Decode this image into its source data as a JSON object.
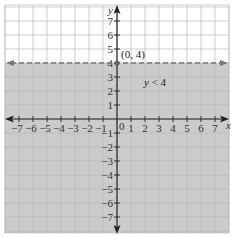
{
  "chart_data": {
    "type": "inequality_graph",
    "title": "",
    "inequality": "y < 4",
    "boundary_line": {
      "equation": "y = 4",
      "style": "dashed",
      "color": "#777777"
    },
    "labeled_point": {
      "x": 0,
      "y": 4,
      "label": "(0, 4)"
    },
    "shaded_region": "below boundary",
    "shade_color": "#cbcbcb",
    "xlabel": "x",
    "ylabel": "y",
    "xlim": [
      -8,
      8
    ],
    "ylim": [
      -8,
      8
    ],
    "x_ticks": [
      -7,
      -6,
      -5,
      -4,
      -3,
      -2,
      -1,
      1,
      2,
      3,
      4,
      5,
      6,
      7
    ],
    "y_ticks": [
      -7,
      -6,
      -5,
      -4,
      -3,
      -2,
      -1,
      1,
      2,
      3,
      4,
      5,
      6,
      7
    ],
    "x_tick_labels": [
      "−7",
      "−6",
      "−5",
      "−4",
      "−3",
      "−2",
      "−1",
      "1",
      "2",
      "3",
      "4",
      "5",
      "6",
      "7"
    ],
    "y_tick_labels": [
      "−7",
      "−6",
      "−5",
      "−4",
      "−3",
      "−2",
      "−1",
      "1",
      "2",
      "3",
      "4",
      "5",
      "6",
      "7"
    ],
    "origin_label": "0",
    "grid": true,
    "annotation": {
      "text_var": "y",
      "text_rest": " < 4",
      "x": 2,
      "y": 2.6
    }
  }
}
